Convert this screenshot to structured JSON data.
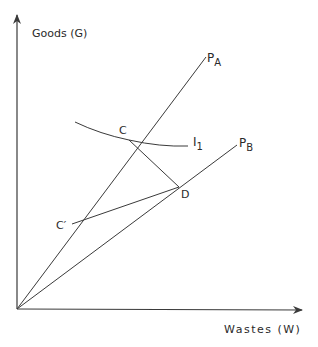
{
  "diagram": {
    "axes": {
      "y_label": "Goods (G)",
      "x_label": "Wastes (W)"
    },
    "rays": [
      {
        "id": "PA",
        "label": "P",
        "subscript": "A"
      },
      {
        "id": "PB",
        "label": "P",
        "subscript": "B"
      }
    ],
    "indifference_curve": {
      "label": "I",
      "subscript": "1"
    },
    "points": {
      "C": "C",
      "D": "D",
      "C_prime": "C′"
    },
    "segments": [
      "C-D",
      "C'-D"
    ],
    "colors": {
      "line": "#3a3a3a",
      "text": "#2a2a2a",
      "background": "#ffffff"
    }
  }
}
